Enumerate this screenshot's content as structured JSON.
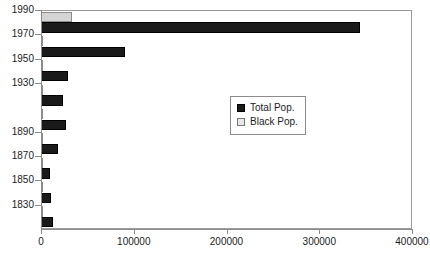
{
  "chart_data": {
    "type": "bar",
    "orientation": "horizontal",
    "title": "",
    "subtitle": "",
    "xlabel": "",
    "ylabel": "",
    "xlim": [
      0,
      400000
    ],
    "ylim_categories_order": "1830 at bottom to 1990 at top",
    "grid": false,
    "legend_position": "center-right-inside",
    "x_ticks": [
      "0",
      "100000",
      "200000",
      "300000",
      "400000"
    ],
    "x_tick_values": [
      0,
      100000,
      200000,
      300000,
      400000
    ],
    "y_tick_labels": [
      "1990",
      "1970",
      "1950",
      "1930",
      "1890",
      "1870",
      "1850",
      "1830"
    ],
    "categories": [
      "1830",
      "1850",
      "1870",
      "1890",
      "1910",
      "1930",
      "1950",
      "1970",
      "1990"
    ],
    "series": [
      {
        "name": "Total Pop.",
        "color": "#1a1a1a",
        "values": [
          13000,
          11000,
          10000,
          18000,
          27000,
          24000,
          29000,
          90000,
          344000
        ]
      },
      {
        "name": "Black Pop.",
        "color": "#d4d4d4",
        "values": [
          1200,
          1200,
          1200,
          1500,
          1500,
          1500,
          2000,
          2500,
          33000
        ]
      }
    ]
  },
  "legend": {
    "items": [
      {
        "label": "Total Pop.",
        "swatch": "filled-dark-square"
      },
      {
        "label": "Black Pop.",
        "swatch": "outlined-light-square"
      }
    ]
  },
  "colors": {
    "total_pop": "#1a1a1a",
    "black_pop": "#d4d4d4",
    "axis": "#8c8c8c",
    "frame": "#9a9a9a",
    "text": "#1c1c1c",
    "background": "#ffffff"
  }
}
